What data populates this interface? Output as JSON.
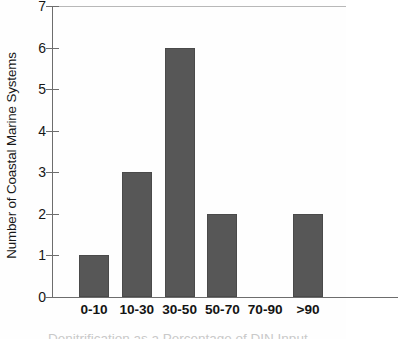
{
  "chart_data": {
    "type": "bar",
    "title": "",
    "subtitle": "",
    "xlabel": "Denitrification as a Percentage of DIN Input",
    "ylabel": "Number of Coastal Marine Systems",
    "categories": [
      "0-10",
      "10-30",
      "30-50",
      "50-70",
      "70-90",
      ">90"
    ],
    "values": [
      1,
      3,
      6,
      2,
      0,
      2
    ],
    "series": [
      {
        "name": "Coastal Marine Systems",
        "values": [
          1,
          3,
          6,
          2,
          0,
          2
        ]
      }
    ],
    "ylim": [
      0,
      7
    ],
    "y_ticks": [
      0,
      1,
      2,
      3,
      4,
      5,
      6,
      7
    ],
    "y_tick_labels": [
      "0",
      "1",
      "2",
      "3",
      "4",
      "5",
      "6",
      "7"
    ],
    "grid": false,
    "legend": "none",
    "bar_color": "#575757",
    "axis_color": "#6d6d6d",
    "background_color": "#fefefe"
  },
  "axes": {
    "y_title": "Number of Coastal Marine Systems",
    "x_title_clipped": "Denitrification as a Percentage of DIN Input"
  }
}
